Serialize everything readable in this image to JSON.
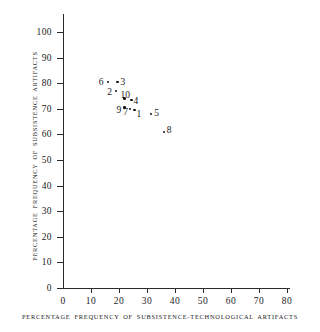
{
  "chart_data": {
    "type": "scatter",
    "title": "",
    "xlabel": "PERCENTAGE FREQUENCY OF SUBSISTENCE-TECHNOLOGICAL ARTIFACTS",
    "ylabel": "PERCENTAGE FREQUENCY OF SUBSISTENCE ARTIFACTS",
    "xlim": [
      0,
      80
    ],
    "ylim": [
      0,
      100
    ],
    "xticks": [
      0,
      10,
      20,
      30,
      40,
      50,
      60,
      70,
      80
    ],
    "yticks": [
      0,
      10,
      20,
      30,
      40,
      50,
      60,
      70,
      80,
      90,
      100
    ],
    "xticklabels": [
      "0",
      "10",
      "20",
      "30",
      "40",
      "50",
      "60",
      "70",
      "80"
    ],
    "yticklabels": [
      "0",
      "10",
      "20",
      "30",
      "40",
      "50",
      "60",
      "70",
      "80",
      "90",
      "100"
    ],
    "grid": false,
    "legend": false,
    "marker_color": "#111111",
    "axis_color": "#2b2b2b",
    "points": [
      {
        "label": "6",
        "x": 16.0,
        "y": 80.5,
        "label_dx": -9,
        "label_dy": -5
      },
      {
        "label": "3",
        "x": 19.5,
        "y": 80.5,
        "label_dx": 3,
        "label_dy": -5
      },
      {
        "label": "2",
        "x": 19.0,
        "y": 77.0,
        "label_dx": -9,
        "label_dy": -4
      },
      {
        "label": "10",
        "x": 22.0,
        "y": 74.0,
        "label_dx": -4,
        "label_dy": -9
      },
      {
        "label": "4",
        "x": 24.5,
        "y": 73.5,
        "label_dx": 2,
        "label_dy": -4
      },
      {
        "label": "9",
        "x": 22.0,
        "y": 70.5,
        "label_dx": -8,
        "label_dy": -3
      },
      {
        "label": "7",
        "x": 24.0,
        "y": 70.0,
        "label_dx": -7,
        "label_dy": -2
      },
      {
        "label": "1",
        "x": 25.5,
        "y": 69.5,
        "label_dx": 2,
        "label_dy": -1
      },
      {
        "label": "5",
        "x": 31.5,
        "y": 68.0,
        "label_dx": 3,
        "label_dy": -6
      },
      {
        "label": "8",
        "x": 36.0,
        "y": 61.0,
        "label_dx": 3,
        "label_dy": -7
      }
    ],
    "plot_geometry": {
      "origin_x_px": 63,
      "origin_y_px": 288,
      "x_px_per_unit": 2.8,
      "y_px_per_unit": 2.56
    }
  }
}
